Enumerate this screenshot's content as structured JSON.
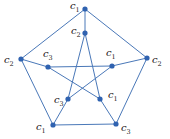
{
  "diagram": {
    "type": "graph",
    "name": "Petersen graph vertex 3-coloring",
    "colors": {
      "edge": "#4a78b8",
      "vertex": "#2f62b0",
      "label": "#222222"
    },
    "vertices": [
      {
        "id": "o0",
        "x": 85,
        "y": 9,
        "label": "c",
        "sub": "1",
        "lx": 70,
        "ly": 9
      },
      {
        "id": "o1",
        "x": 147,
        "y": 58,
        "label": "c",
        "sub": "2",
        "lx": 152,
        "ly": 63
      },
      {
        "id": "o2",
        "x": 116,
        "y": 124,
        "label": "c",
        "sub": "3",
        "lx": 121,
        "ly": 131
      },
      {
        "id": "o3",
        "x": 53,
        "y": 125,
        "label": "c",
        "sub": "1",
        "lx": 36,
        "ly": 130
      },
      {
        "id": "o4",
        "x": 21,
        "y": 59,
        "label": "c",
        "sub": "2",
        "lx": 4,
        "ly": 63
      },
      {
        "id": "i0",
        "x": 85,
        "y": 33,
        "label": "c",
        "sub": "2",
        "lx": 71,
        "ly": 34
      },
      {
        "id": "i1",
        "x": 112,
        "y": 66,
        "label": "c",
        "sub": "1",
        "lx": 106,
        "ly": 56
      },
      {
        "id": "i2",
        "x": 100,
        "y": 99,
        "label": "c",
        "sub": "1",
        "lx": 108,
        "ly": 98
      },
      {
        "id": "i3",
        "x": 68,
        "y": 99,
        "label": "c",
        "sub": "3",
        "lx": 54,
        "ly": 103
      },
      {
        "id": "i4",
        "x": 48,
        "y": 67,
        "label": "c",
        "sub": "3",
        "lx": 43,
        "ly": 57
      }
    ],
    "edges": [
      [
        "o0",
        "o1"
      ],
      [
        "o1",
        "o2"
      ],
      [
        "o2",
        "o3"
      ],
      [
        "o3",
        "o4"
      ],
      [
        "o4",
        "o0"
      ],
      [
        "o0",
        "i0"
      ],
      [
        "o1",
        "i1"
      ],
      [
        "o2",
        "i2"
      ],
      [
        "o3",
        "i3"
      ],
      [
        "o4",
        "i4"
      ],
      [
        "i0",
        "i2"
      ],
      [
        "i2",
        "i4"
      ],
      [
        "i4",
        "i1"
      ],
      [
        "i1",
        "i3"
      ],
      [
        "i3",
        "i0"
      ]
    ]
  }
}
